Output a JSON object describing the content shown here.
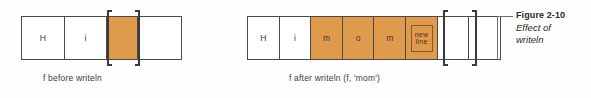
{
  "figure": {
    "number": "Figure 2-10",
    "title_line1": "Effect of",
    "title_line2": "writeln"
  },
  "colors": {
    "fill": "#e09a4e",
    "border": "#4a4a4a",
    "bracket": "#3a3a3a",
    "text": "#3b3b3b",
    "background": "#fefefe"
  },
  "diagrams": [
    {
      "id": "before",
      "caption": "f before writeln",
      "bracket_index": 2,
      "cells": [
        {
          "label": "H",
          "filled": false,
          "type": "char"
        },
        {
          "label": "i",
          "filled": false,
          "type": "char"
        },
        {
          "label": "",
          "filled": true,
          "type": "current"
        },
        {
          "label": "",
          "filled": false,
          "type": "empty-wide"
        }
      ]
    },
    {
      "id": "after",
      "caption": "f after writeln (f, 'mom')",
      "bracket_index": 6,
      "cells": [
        {
          "label": "H",
          "filled": false,
          "type": "char"
        },
        {
          "label": "i",
          "filled": false,
          "type": "char"
        },
        {
          "label": "m",
          "filled": true,
          "type": "char"
        },
        {
          "label": "o",
          "filled": true,
          "type": "char"
        },
        {
          "label": "m",
          "filled": true,
          "type": "char"
        },
        {
          "label": "new line",
          "label_line1": "new",
          "label_line2": "line",
          "filled": true,
          "type": "newline"
        },
        {
          "label": "",
          "filled": false,
          "type": "empty"
        },
        {
          "label": "",
          "filled": false,
          "type": "empty"
        }
      ]
    }
  ]
}
